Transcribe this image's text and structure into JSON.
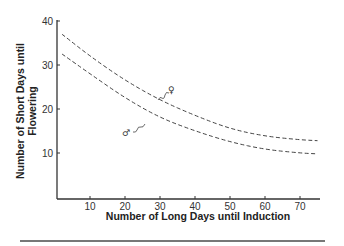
{
  "chart_data": {
    "type": "line",
    "title": "",
    "xlabel": "Number of Long Days until Induction",
    "ylabel": "Number of Short Days until Flowering",
    "xlim": [
      0,
      75
    ],
    "ylim": [
      0,
      40
    ],
    "x_ticks": [
      10,
      20,
      30,
      40,
      50,
      60,
      70
    ],
    "y_ticks": [
      10,
      20,
      30,
      40
    ],
    "grid": false,
    "legend": "none (curves labeled inline with sex symbols)",
    "series": [
      {
        "name": "♀",
        "style": "dashed",
        "x": [
          2,
          10,
          20,
          30,
          40,
          50,
          60,
          70,
          75
        ],
        "values": [
          37,
          32,
          26.5,
          22,
          18.5,
          15.5,
          13.8,
          13,
          12.8
        ]
      },
      {
        "name": "♂",
        "style": "dashed",
        "x": [
          2,
          10,
          20,
          30,
          40,
          50,
          60,
          70,
          75
        ],
        "values": [
          32.5,
          28,
          22.5,
          18,
          15,
          12.5,
          10.8,
          10,
          9.8
        ]
      }
    ],
    "annotations": [
      "♀",
      "♂"
    ]
  }
}
